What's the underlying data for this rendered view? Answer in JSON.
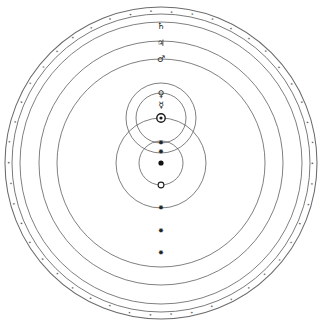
{
  "diagram": {
    "type": "astronomical-orbit-diagram",
    "center": {
      "x": 161,
      "y": 163
    },
    "canvas": {
      "width": 321,
      "height": 326
    },
    "colors": {
      "orbit_stroke": "#565656",
      "band_stroke": "#6b6b6b",
      "glyph_fill": "#1b1b1b",
      "background": "#ffffff"
    },
    "fixed_star_sphere": {
      "name": "sphere-of-fixed-stars",
      "outer_radius": 156,
      "inner_radius": 149,
      "star_count": 46,
      "star_glyph": "✶"
    },
    "orbits": [
      {
        "id": "saturn",
        "label": "♄",
        "name": "Saturn",
        "cx": 161,
        "cy": 163,
        "r": 141,
        "label_x": 161,
        "label_y": 26
      },
      {
        "id": "jupiter",
        "label": "♃",
        "name": "Jupiter",
        "cx": 161,
        "cy": 163,
        "r": 122,
        "label_x": 161,
        "label_y": 44
      },
      {
        "id": "mars",
        "label": "♂",
        "name": "Mars",
        "cx": 161,
        "cy": 163,
        "r": 104,
        "label_x": 161,
        "label_y": 60
      },
      {
        "id": "venus",
        "label": "♀",
        "name": "Venus",
        "cx": 161,
        "cy": 118,
        "r": 35,
        "label_x": 161,
        "label_y": 95
      },
      {
        "id": "mercury",
        "label": "☿",
        "name": "Mercury",
        "cx": 161,
        "cy": 118,
        "r": 25,
        "label_x": 161,
        "label_y": 106
      },
      {
        "id": "sun-annual",
        "label": "",
        "name": "Solar annual orbit",
        "cx": 161,
        "cy": 163,
        "r": 45,
        "label_x": 0,
        "label_y": 0
      },
      {
        "id": "moon",
        "label": "",
        "name": "Lunar orbit",
        "cx": 161,
        "cy": 163,
        "r": 22,
        "label_x": 0,
        "label_y": 0
      }
    ],
    "bodies": [
      {
        "id": "sun",
        "name": "Sun",
        "glyph": "☉",
        "x": 161,
        "y": 118
      },
      {
        "id": "earth",
        "name": "Earth",
        "glyph": "•",
        "x": 161,
        "y": 163
      },
      {
        "id": "moon",
        "name": "Moon",
        "glyph": "○",
        "x": 161,
        "y": 185
      }
    ],
    "node_markers": [
      {
        "id": "node-venus-lower",
        "glyph": "✸",
        "x": 161,
        "y": 143
      },
      {
        "id": "node-mercury-lower",
        "glyph": "✸",
        "x": 161,
        "y": 152
      },
      {
        "id": "node-mars-lower",
        "glyph": "✸",
        "x": 161,
        "y": 208
      },
      {
        "id": "node-jupiter-lower",
        "glyph": "✸",
        "x": 161,
        "y": 231
      },
      {
        "id": "node-saturn-lower",
        "glyph": "✸",
        "x": 161,
        "y": 253
      }
    ],
    "legend_note": "Earth at centre with the Moon; the Sun carries Mercury and Venus; Mars, Jupiter and Saturn encircle all, within the sphere of fixed stars."
  }
}
